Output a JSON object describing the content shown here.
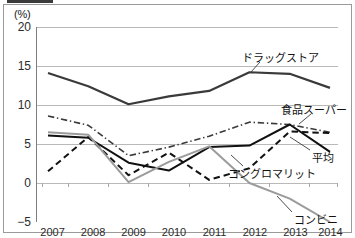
{
  "figure": {
    "unit_label": "(%)"
  },
  "chart_data": {
    "type": "line",
    "title": "",
    "xlabel": "",
    "ylabel": "(%)",
    "x": [
      2007,
      2008,
      2009,
      2010,
      2011,
      2012,
      2013,
      2014
    ],
    "categories": [
      "2007",
      "2008",
      "2009",
      "2010",
      "2011",
      "2012",
      "2013",
      "2014"
    ],
    "ylim": [
      -5,
      20
    ],
    "yticks": [
      20,
      15,
      10,
      5,
      0,
      -5
    ],
    "ytick_labels": [
      "20",
      "15",
      "10",
      "5",
      "0",
      "−5"
    ],
    "grid": "horizontal",
    "legend_position": "inline-annotations",
    "series": [
      {
        "name": "ドラッグストア",
        "label": "ドラッグストア",
        "style": "solid",
        "color": "#3a3a3a",
        "width": 2.2,
        "values": [
          14.1,
          12.4,
          10.1,
          11.1,
          11.8,
          14.2,
          14.0,
          12.2
        ]
      },
      {
        "name": "食品スーパー",
        "label": "食品スーパー",
        "style": "dash-dot",
        "color": "#3a3a3a",
        "width": 1.6,
        "values": [
          8.6,
          7.4,
          3.5,
          4.6,
          6.0,
          7.8,
          7.5,
          6.5
        ]
      },
      {
        "name": "平均",
        "label": "平均",
        "style": "solid",
        "color": "#111111",
        "width": 2.0,
        "values": [
          6.1,
          5.8,
          2.6,
          1.6,
          4.6,
          4.8,
          7.5,
          4.0
        ]
      },
      {
        "name": "コングロマリット",
        "label": "コングロマリット",
        "style": "dashed",
        "color": "#111111",
        "width": 2.0,
        "values": [
          1.5,
          5.9,
          1.0,
          3.9,
          0.4,
          1.9,
          6.6,
          6.4
        ]
      },
      {
        "name": "コンビニ",
        "label": "コンビニ",
        "style": "solid",
        "color": "#9b9b9b",
        "width": 2.0,
        "values": [
          6.5,
          6.2,
          0.1,
          2.7,
          4.7,
          0.0,
          -2.0,
          -5.0
        ]
      }
    ],
    "annotations": [
      {
        "text": "ドラッグストア",
        "x_px": 242,
        "y_px": 52,
        "leader": {
          "x1": 260,
          "y1": 62,
          "x2": 251,
          "y2": 72
        }
      },
      {
        "text": "食品スーパー",
        "x_px": 281,
        "y_px": 104,
        "leader": {
          "x1": 311,
          "y1": 114,
          "x2": 299,
          "y2": 124
        }
      },
      {
        "text": "平均",
        "x_px": 312,
        "y_px": 152,
        "leader": {
          "x1": 310,
          "y1": 150,
          "x2": 290,
          "y2": 137
        }
      },
      {
        "text": "コングロマリット",
        "x_px": 228,
        "y_px": 168,
        "leader": {
          "x1": 243,
          "y1": 166,
          "x2": 231,
          "y2": 155
        }
      },
      {
        "text": "コンビニ",
        "x_px": 294,
        "y_px": 214,
        "leader": {
          "x1": 292,
          "y1": 212,
          "x2": 277,
          "y2": 196
        }
      }
    ]
  }
}
